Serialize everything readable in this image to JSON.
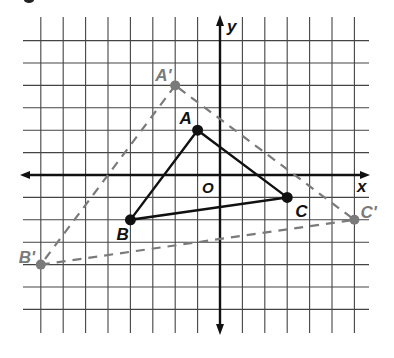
{
  "figure": {
    "axes": {
      "x_label": "x",
      "y_label": "y",
      "origin_label": "O"
    },
    "grid": {
      "origin_px": [
        220,
        175
      ],
      "unit_px": 22.4,
      "x_range": [
        -9,
        6
      ],
      "y_range": [
        -7,
        7
      ]
    },
    "triangle_original": {
      "style": "solid",
      "color": "#111111",
      "points": [
        {
          "label": "A",
          "x": -1,
          "y": 2
        },
        {
          "label": "B",
          "x": -4,
          "y": -2
        },
        {
          "label": "C",
          "x": 3,
          "y": -1
        }
      ]
    },
    "triangle_image": {
      "style": "dashed",
      "color": "#7a7a7a",
      "points": [
        {
          "label": "A'",
          "x": -2,
          "y": 4
        },
        {
          "label": "B'",
          "x": -8,
          "y": -4
        },
        {
          "label": "C'",
          "x": 6,
          "y": -2
        }
      ]
    }
  }
}
